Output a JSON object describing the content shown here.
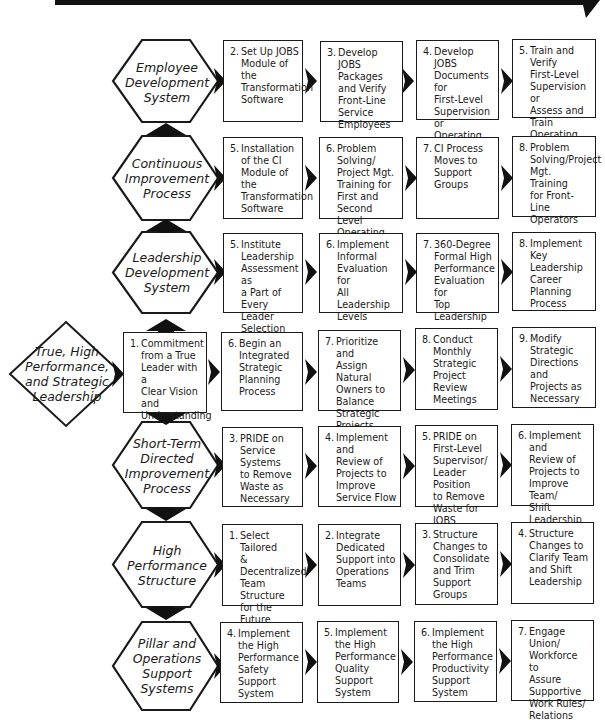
{
  "banner": {
    "text": "",
    "color": "#111111"
  },
  "colors": {
    "stroke": "#1a1a1a",
    "arrow": "#111111",
    "background": "#ffffff"
  },
  "start": {
    "label": "True, High\nPerformance,\nand Strategic\nLeadership",
    "shape": "diamond"
  },
  "rows": [
    {
      "label": "Employee\nDevelopment\nSystem",
      "steps": [
        {
          "num": "2.",
          "text": "Set Up JOBS\nModule of the\nTransformation\nSoftware"
        },
        {
          "num": "3.",
          "text": "Develop\nJOBS Packages\nand Verify\nFront-Line\nService\nEmployees"
        },
        {
          "num": "4.",
          "text": "Develop JOBS\nDocuments for\nFirst-Level\nSupervision or\nOperating\nLeader"
        },
        {
          "num": "5.",
          "text": "Train and Verify\nFirst-Level\nSupervision or\nAssess and Train\nOperating\nLeaders"
        }
      ]
    },
    {
      "label": "Continuous\nImprovement\nProcess",
      "steps": [
        {
          "num": "5.",
          "text": "Installation\nof the CI\nModule of the\nTransformation\nSoftware"
        },
        {
          "num": "6.",
          "text": "Problem Solving/\nProject Mgt.\nTraining for\nFirst and Second\nLevel Operating\nLeaders"
        },
        {
          "num": "7.",
          "text": "CI Process\nMoves to\nSupport\nGroups"
        },
        {
          "num": "8.",
          "text": "Problem\nSolving/Project\nMgt. Training\nfor Front-Line\nOperators"
        }
      ]
    },
    {
      "label": "Leadership\nDevelopment\nSystem",
      "steps": [
        {
          "num": "5.",
          "text": "Institute\nLeadership\nAssessment as\na Part of Every\nLeader Selection"
        },
        {
          "num": "6.",
          "text": "Implement\nInformal\nEvaluation for\nAll Leadership\nLevels"
        },
        {
          "num": "7.",
          "text": "360-Degree\nFormal High\nPerformance\nEvaluation for\nTop Leadership"
        },
        {
          "num": "8.",
          "text": "Implement\nKey Leadership\nCareer\nPlanning\nProcess"
        }
      ]
    },
    {
      "label": "",
      "is_core": true,
      "steps": [
        {
          "num": "1.",
          "text": "Commitment\nfrom a True\nLeader with a\nClear Vision and\nUnderstanding"
        },
        {
          "num": "6.",
          "text": "Begin an\nIntegrated\nStrategic\nPlanning\nProcess"
        },
        {
          "num": "7.",
          "text": "Prioritize and\nAssign Natural\nOwners to\nBalance\nStrategic\nProjects"
        },
        {
          "num": "8.",
          "text": "Conduct\nMonthly\nStrategic\nProject\nReview\nMeetings"
        },
        {
          "num": "9.",
          "text": "Modify\nStrategic\nDirections and\nProjects as\nNecessary"
        }
      ]
    },
    {
      "label": "Short-Term\nDirected\nImprovement\nProcess",
      "steps": [
        {
          "num": "3.",
          "text": "PRIDE on\nService Systems\nto Remove\nWaste as\nNecessary"
        },
        {
          "num": "4.",
          "text": "Implement and\nReview of\nProjects to\nImprove\nService Flow"
        },
        {
          "num": "5.",
          "text": "PRIDE on\nFirst-Level\nSupervisor/\nLeader Position\nto Remove\nWaste for JOBS"
        },
        {
          "num": "6.",
          "text": "Implement and\nReview of\nProjects to\nImprove Team/\nShift Leadership"
        }
      ]
    },
    {
      "label": "High\nPerformance\nStructure",
      "steps": [
        {
          "num": "1.",
          "text": "Select Tailored\n& Decentralized\nTeam Structure\nfor the Future"
        },
        {
          "num": "2.",
          "text": "Integrate\nDedicated\nSupport into\nOperations\nTeams"
        },
        {
          "num": "3.",
          "text": "Structure\nChanges to\nConsolidate\nand Trim\nSupport Groups"
        },
        {
          "num": "4.",
          "text": "Structure\nChanges to\nClarify Team\nand Shift\nLeadership"
        }
      ]
    },
    {
      "label": "Pillar and\nOperations\nSupport\nSystems",
      "steps": [
        {
          "num": "4.",
          "text": "Implement\nthe High\nPerformance\nSafety Support\nSystem"
        },
        {
          "num": "5.",
          "text": "Implement\nthe High\nPerformance\nQuality\nSupport System"
        },
        {
          "num": "6.",
          "text": "Implement\nthe High\nPerformance\nProductivity\nSupport System"
        },
        {
          "num": "7.",
          "text": "Engage Union/\nWorkforce to\nAssure\nSupportive\nWork Rules/\nRelations"
        }
      ]
    }
  ]
}
